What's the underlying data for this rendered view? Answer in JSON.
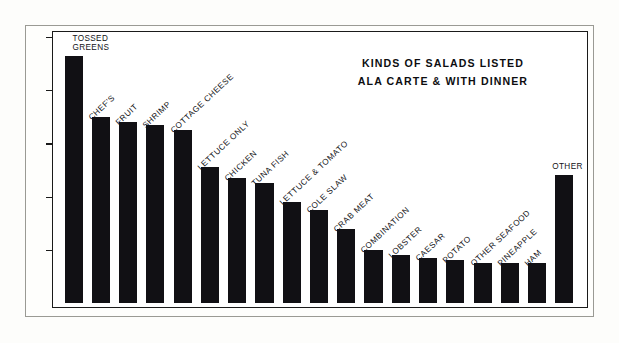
{
  "chart_data": {
    "type": "bar",
    "title": "KINDS OF SALADS LISTED ALA CARTE & WITH DINNER",
    "title_line1": "KINDS OF SALADS LISTED",
    "title_line2": "ALA CARTE & WITH DINNER",
    "xlabel": "",
    "ylabel": "",
    "ylim": [
      0,
      105
    ],
    "grid": false,
    "legend": "none",
    "yticks": [
      20,
      40,
      60,
      80,
      100
    ],
    "ytick_labels": [
      "20",
      "40",
      "60",
      "80",
      "100"
    ],
    "categories": [
      "TOSSED GREENS",
      "CHEF'S",
      "FRUIT",
      "SHRIMP",
      "COTTAGE CHEESE",
      "LETTUCE ONLY",
      "CHICKEN",
      "TUNA FISH",
      "LETTUCE & TOMATO",
      "COLE SLAW",
      "CRAB MEAT",
      "COMBINATION",
      "LOBSTER",
      "CAESAR",
      "POTATO",
      "OTHER SEAFOOD",
      "PINEAPPLE",
      "HAM",
      "OTHER"
    ],
    "values": [
      93,
      70,
      68,
      67,
      65,
      51,
      47,
      45,
      38,
      35,
      28,
      20,
      18,
      17,
      16,
      15,
      15,
      15,
      48
    ],
    "bar_color": "#111014",
    "background_color": "#ffffff",
    "axis_color": "#1a1a1a"
  },
  "labels": {
    "tossed_greens_line1": "TOSSED",
    "tossed_greens_line2": "GREENS",
    "other": "OTHER"
  }
}
